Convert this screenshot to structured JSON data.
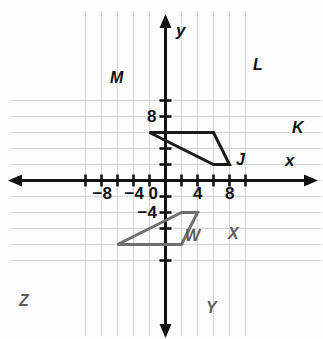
{
  "figure": {
    "grid": {
      "visible": true,
      "color": "#d6d6d6",
      "spacing_units": 2
    },
    "axes": {
      "x_label": "x",
      "y_label": "y",
      "color": "#111111",
      "x_range": [
        -10,
        10
      ],
      "y_range": [
        -10,
        10
      ]
    },
    "tick_labels": {
      "x": [
        {
          "text": "−8",
          "value": -8
        },
        {
          "text": "−4",
          "value": -4
        },
        {
          "text": "0",
          "value": 0
        },
        {
          "text": "4",
          "value": 4
        },
        {
          "text": "8",
          "value": 8
        }
      ],
      "y": [
        {
          "text": "8",
          "value": 8
        },
        {
          "text": "−4",
          "value": -4
        }
      ]
    },
    "shapes": [
      {
        "name": "quadrilateral-jklm",
        "color": "#1a1a1a",
        "stroke_width": 3,
        "closed": true,
        "vertices": [
          {
            "label": "M",
            "x": -2,
            "y": 6
          },
          {
            "label": "L",
            "x": 6,
            "y": 6
          },
          {
            "label": "K",
            "x": 8,
            "y": 2
          },
          {
            "label": "J",
            "x": 6,
            "y": 2
          }
        ]
      },
      {
        "name": "quadrilateral-wxyz",
        "color": "#707070",
        "stroke_width": 3,
        "closed": true,
        "vertices": [
          {
            "label": "W",
            "x": 2,
            "y": -4
          },
          {
            "label": "X",
            "x": 4,
            "y": -4
          },
          {
            "label": "Y",
            "x": 2,
            "y": -8
          },
          {
            "label": "Z",
            "x": -6,
            "y": -8
          }
        ]
      }
    ],
    "vertex_label_positions": [
      {
        "label": "M",
        "shape": "quadrilateral-jklm",
        "left": 110,
        "top": 70
      },
      {
        "label": "L",
        "shape": "quadrilateral-jklm",
        "left": 253,
        "top": 57
      },
      {
        "label": "K",
        "shape": "quadrilateral-jklm",
        "left": 292,
        "top": 120
      },
      {
        "label": "J",
        "shape": "quadrilateral-jklm",
        "left": 236,
        "top": 152
      },
      {
        "label": "W",
        "shape": "quadrilateral-wxyz",
        "left": 185,
        "top": 228
      },
      {
        "label": "X",
        "shape": "quadrilateral-wxyz",
        "left": 228,
        "top": 226
      },
      {
        "label": "Y",
        "shape": "quadrilateral-wxyz",
        "left": 206,
        "top": 300
      },
      {
        "label": "Z",
        "shape": "quadrilateral-wxyz",
        "left": 19,
        "top": 293
      }
    ]
  }
}
